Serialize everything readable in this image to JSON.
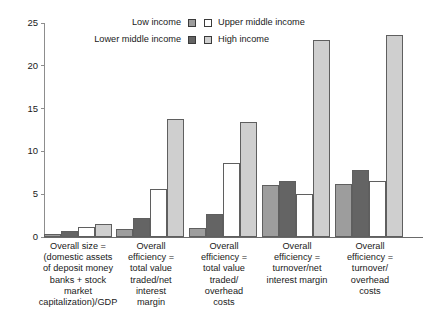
{
  "chart_data": {
    "type": "bar",
    "title": "",
    "subtitle": "",
    "xlabel": "",
    "ylabel": "",
    "ylim": [
      0,
      25
    ],
    "yticks": [
      0,
      5,
      10,
      15,
      20,
      25
    ],
    "grid": false,
    "legend_position": "top-center",
    "categories": [
      "Overall size = (domestic assets of deposit money banks + stock market capitalization)/GDP",
      "Overall efficiency = total value traded/net interest margin",
      "Overall efficiency = total value traded/overhead costs",
      "Overall efficiency = turnover/net interest margin",
      "Overall efficiency = turnover/overhead costs"
    ],
    "category_lines": [
      [
        "Overall size =",
        "(domestic assets",
        "of deposit money",
        "banks + stock",
        "market",
        "capitalization)/GDP"
      ],
      [
        "Overall",
        "efficiency =",
        "total value",
        "traded/net",
        "interest",
        "margin"
      ],
      [
        "Overall",
        "efficiency =",
        "total value",
        "traded/",
        "overhead",
        "costs"
      ],
      [
        "Overall",
        "efficiency =",
        "turnover/net",
        "interest margin"
      ],
      [
        "Overall",
        "efficiency =",
        "turnover/",
        "overhead",
        "costs"
      ]
    ],
    "series": [
      {
        "name": "Low income",
        "color": "#9d9d9d",
        "values": [
          0.3,
          0.9,
          1.0,
          6.1,
          6.2
        ]
      },
      {
        "name": "Lower middle income",
        "color": "#646464",
        "values": [
          0.7,
          2.2,
          2.7,
          6.5,
          7.8
        ]
      },
      {
        "name": "Upper middle income",
        "color": "#ffffff",
        "values": [
          1.2,
          5.6,
          8.7,
          5.0,
          6.5
        ]
      },
      {
        "name": "High income",
        "color": "#cfcfcf",
        "values": [
          1.5,
          13.8,
          13.4,
          23.0,
          23.6
        ]
      }
    ]
  },
  "legend": {
    "entries": [
      {
        "label": "Low income",
        "color": "#9d9d9d"
      },
      {
        "label": "Lower middle income",
        "color": "#646464"
      },
      {
        "label": "Upper middle income",
        "color": "#ffffff"
      },
      {
        "label": "High income",
        "color": "#cfcfcf"
      }
    ]
  },
  "axis": {
    "y_tick_labels": [
      "25",
      "20",
      "15",
      "10",
      "5",
      "0"
    ]
  }
}
